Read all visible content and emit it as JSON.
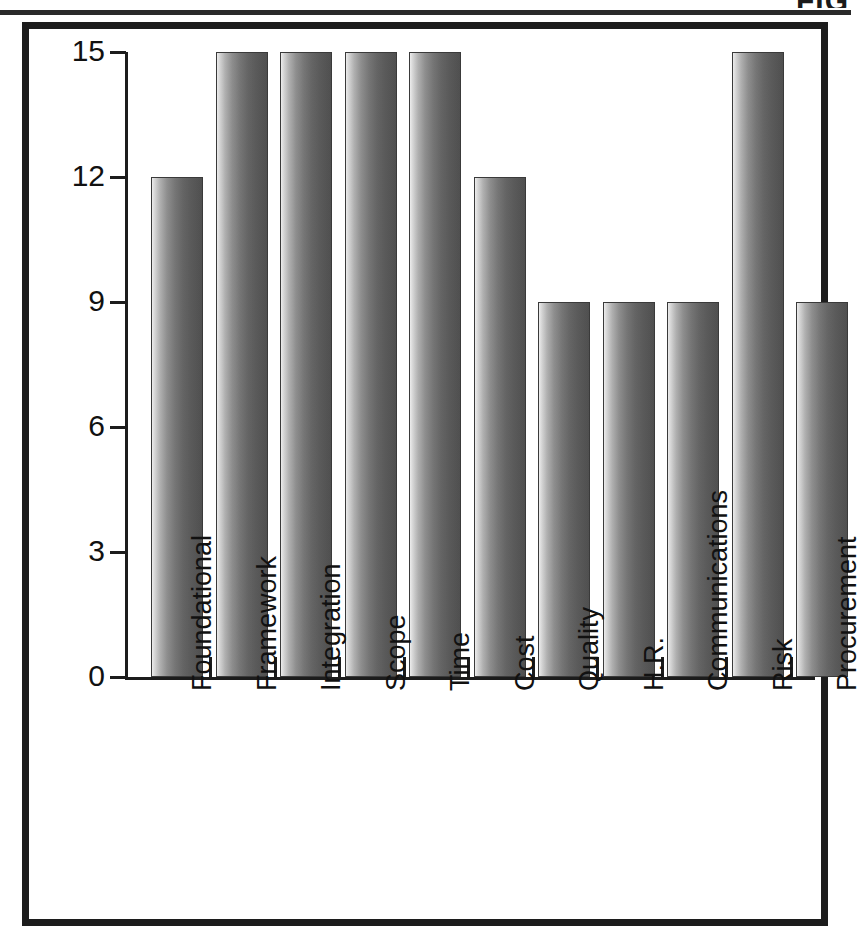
{
  "page": {
    "figure_caption": "FIG"
  },
  "chart_data": {
    "type": "bar",
    "title": "",
    "subtitle": "",
    "xlabel": "",
    "ylabel": "",
    "ylim": [
      0,
      15
    ],
    "yticks": [
      0,
      3,
      6,
      9,
      12,
      15
    ],
    "ytick_labels": [
      "0",
      "3",
      "6",
      "9",
      "12",
      "15"
    ],
    "grid": false,
    "legend": null,
    "categories": [
      "Foundational",
      "Framework",
      "Integration",
      "Scope",
      "Time",
      "Cost",
      "Quality",
      "H.R.",
      "Communications",
      "Risk",
      "Procurement"
    ],
    "values": [
      12,
      15,
      15,
      15,
      15,
      12,
      9,
      9,
      9,
      15,
      9
    ],
    "bar_color": "#6b6b6b",
    "bar_edge_color": "#3a3a3a",
    "frame_color": "#1c1c1c",
    "background_color": "#ffffff"
  }
}
